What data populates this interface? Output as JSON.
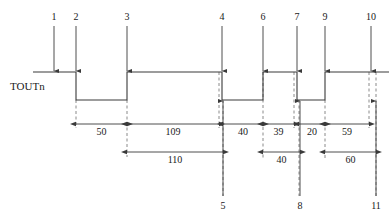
{
  "diagram": {
    "kind": "timing-diagram",
    "signal_name": "TOUTn",
    "colors": {
      "line": "#3a3a3a",
      "text": "#1a1a1a",
      "dashed": "#8a8a8a"
    },
    "waveform": {
      "high_y": 72,
      "low_y": 100,
      "start_x": 33,
      "end_x": 389,
      "segments": [
        {
          "level": "high",
          "from": 33,
          "to": 76
        },
        {
          "level": "low",
          "from": 76,
          "to": 127
        },
        {
          "level": "high",
          "from": 127,
          "to": 222
        },
        {
          "level": "low",
          "from": 222,
          "to": 263
        },
        {
          "level": "high",
          "from": 263,
          "to": 297
        },
        {
          "level": "low",
          "from": 297,
          "to": 325
        },
        {
          "level": "high",
          "from": 325,
          "to": 389
        }
      ]
    },
    "top_markers": [
      {
        "label": "1",
        "x": 54
      },
      {
        "label": "2",
        "x": 76
      },
      {
        "label": "3",
        "x": 127
      },
      {
        "label": "4",
        "x": 222
      },
      {
        "label": "6",
        "x": 263
      },
      {
        "label": "7",
        "x": 297
      },
      {
        "label": "9",
        "x": 325
      },
      {
        "label": "10",
        "x": 371
      }
    ],
    "bottom_markers": [
      {
        "label": "5",
        "x": 223
      },
      {
        "label": "8",
        "x": 300
      },
      {
        "label": "11",
        "x": 376
      }
    ],
    "dimensions_row1": [
      {
        "label": "50",
        "from": 76,
        "to": 127
      },
      {
        "label": "109",
        "from": 127,
        "to": 219
      },
      {
        "label": "40",
        "from": 223,
        "to": 263
      },
      {
        "label": "39",
        "from": 263,
        "to": 294
      },
      {
        "label": "20",
        "from": 299,
        "to": 325
      },
      {
        "label": "59",
        "from": 325,
        "to": 369
      }
    ],
    "dimensions_row2": [
      {
        "label": "110",
        "from": 127,
        "to": 223
      },
      {
        "label": "40",
        "from": 263,
        "to": 300
      },
      {
        "label": "60",
        "from": 325,
        "to": 376
      }
    ],
    "dashed_verticals": [
      {
        "x": 76,
        "from": 100,
        "to": 128
      },
      {
        "x": 127,
        "from": 100,
        "to": 157
      },
      {
        "x": 219,
        "from": 72,
        "to": 128
      },
      {
        "x": 223,
        "from": 100,
        "to": 196
      },
      {
        "x": 263,
        "from": 72,
        "to": 160
      },
      {
        "x": 294,
        "from": 72,
        "to": 128
      },
      {
        "x": 299,
        "from": 100,
        "to": 196
      },
      {
        "x": 325,
        "from": 100,
        "to": 160
      },
      {
        "x": 369,
        "from": 72,
        "to": 128
      },
      {
        "x": 376,
        "from": 72,
        "to": 196
      }
    ]
  }
}
